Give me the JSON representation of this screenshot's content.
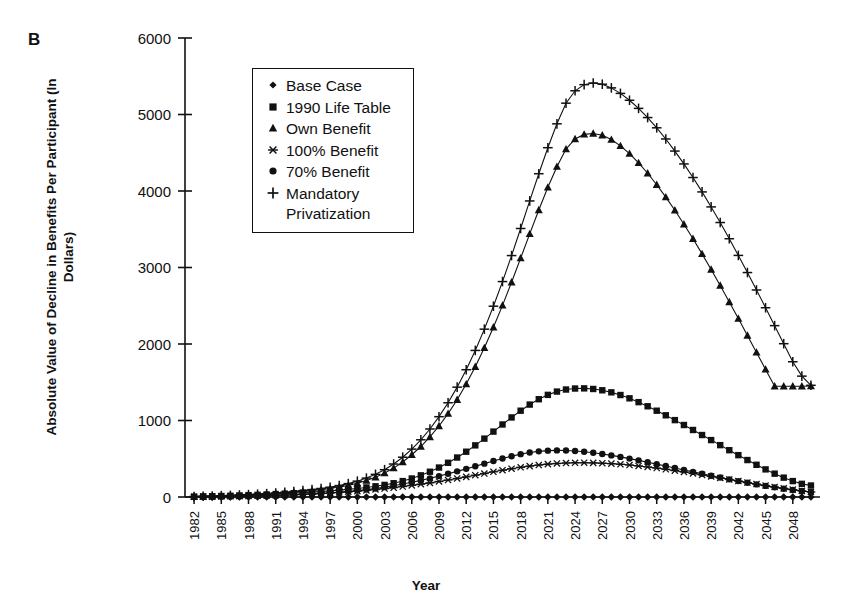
{
  "panel_label": "B",
  "axes": {
    "ylabel": "Absolute Value of Decline in Benefits Per Participant (In Dollars)",
    "xlabel": "Year"
  },
  "legend": {
    "items": [
      {
        "label": "Base Case",
        "marker": "diamond-marker"
      },
      {
        "label": "1990 Life Table",
        "marker": "square-marker"
      },
      {
        "label": "Own Benefit",
        "marker": "triangle-marker"
      },
      {
        "label": "100% Benefit",
        "marker": "asterisk-marker"
      },
      {
        "label": "70% Benefit",
        "marker": "circle-marker"
      },
      {
        "label": "Mandatory\nPrivatization",
        "marker": "plus-marker"
      }
    ]
  },
  "chart_data": {
    "type": "line",
    "title": "",
    "xlabel": "Year",
    "ylabel": "Absolute Value of Decline in Benefits Per Participant (In Dollars)",
    "xlim": [
      1981,
      2051
    ],
    "ylim": [
      0,
      6000
    ],
    "ytick_values": [
      0,
      1000,
      2000,
      3000,
      4000,
      5000,
      6000
    ],
    "ytick_labels": [
      "0",
      "1000",
      "2000",
      "3000",
      "4000",
      "5000",
      "6000"
    ],
    "xtick_labels": [
      "1982",
      "1985",
      "1988",
      "1991",
      "1994",
      "1997",
      "2000",
      "2003",
      "2006",
      "2009",
      "2012",
      "2015",
      "2018",
      "2021",
      "2024",
      "2027",
      "2030",
      "2033",
      "2036",
      "2039",
      "2042",
      "2045",
      "2048"
    ],
    "grid": false,
    "legend_position": "upper-left-inside",
    "x": [
      1982,
      1983,
      1984,
      1985,
      1986,
      1987,
      1988,
      1989,
      1990,
      1991,
      1992,
      1993,
      1994,
      1995,
      1996,
      1997,
      1998,
      1999,
      2000,
      2001,
      2002,
      2003,
      2004,
      2005,
      2006,
      2007,
      2008,
      2009,
      2010,
      2011,
      2012,
      2013,
      2014,
      2015,
      2016,
      2017,
      2018,
      2019,
      2020,
      2021,
      2022,
      2023,
      2024,
      2025,
      2026,
      2027,
      2028,
      2029,
      2030,
      2031,
      2032,
      2033,
      2034,
      2035,
      2036,
      2037,
      2038,
      2039,
      2040,
      2041,
      2042,
      2043,
      2044,
      2045,
      2046,
      2047,
      2048,
      2049,
      2050
    ],
    "series": [
      {
        "name": "Base Case",
        "marker": "diamond",
        "values": [
          0,
          0,
          0,
          0,
          0,
          0,
          0,
          0,
          0,
          0,
          0,
          0,
          0,
          0,
          0,
          0,
          0,
          0,
          0,
          0,
          0,
          0,
          0,
          0,
          0,
          0,
          0,
          0,
          0,
          0,
          0,
          0,
          0,
          0,
          0,
          0,
          0,
          0,
          0,
          0,
          0,
          0,
          0,
          0,
          0,
          0,
          0,
          0,
          0,
          0,
          0,
          0,
          0,
          0,
          0,
          0,
          0,
          0,
          0,
          0,
          0,
          0,
          0,
          0,
          0,
          0,
          0,
          0,
          0
        ]
      },
      {
        "name": "1990 Life Table",
        "marker": "square",
        "values": [
          5,
          8,
          10,
          13,
          16,
          20,
          24,
          28,
          33,
          38,
          44,
          50,
          57,
          64,
          72,
          80,
          90,
          100,
          112,
          125,
          140,
          158,
          180,
          208,
          242,
          283,
          330,
          385,
          447,
          516,
          592,
          675,
          763,
          855,
          948,
          1040,
          1128,
          1208,
          1278,
          1335,
          1378,
          1405,
          1418,
          1420,
          1412,
          1395,
          1368,
          1333,
          1290,
          1240,
          1186,
          1128,
          1068,
          1005,
          941,
          876,
          810,
          744,
          678,
          612,
          547,
          483,
          421,
          361,
          305,
          253,
          208,
          172,
          150
        ]
      },
      {
        "name": "Own Benefit",
        "marker": "triangle",
        "values": [
          6,
          9,
          12,
          15,
          19,
          23,
          28,
          33,
          39,
          46,
          54,
          63,
          73,
          84,
          97,
          112,
          130,
          152,
          180,
          215,
          258,
          312,
          378,
          458,
          552,
          660,
          785,
          928,
          1090,
          1272,
          1476,
          1702,
          1950,
          2218,
          2505,
          2808,
          3122,
          3440,
          3752,
          4048,
          4318,
          4548,
          4680,
          4740,
          4752,
          4728,
          4672,
          4590,
          4488,
          4368,
          4232,
          4082,
          3920,
          3748,
          3566,
          3376,
          3178,
          2974,
          2764,
          2550,
          2332,
          2112,
          1890,
          1668,
          1448,
          1448,
          1448,
          1448,
          1450
        ]
      },
      {
        "name": "100% Benefit",
        "marker": "asterisk",
        "values": [
          3,
          4,
          5,
          7,
          9,
          11,
          13,
          16,
          19,
          22,
          26,
          30,
          35,
          40,
          46,
          53,
          60,
          68,
          77,
          87,
          98,
          110,
          123,
          137,
          152,
          168,
          185,
          203,
          222,
          242,
          263,
          285,
          307,
          329,
          350,
          370,
          388,
          404,
          418,
          430,
          438,
          444,
          447,
          448,
          446,
          442,
          436,
          428,
          418,
          406,
          393,
          378,
          362,
          345,
          327,
          308,
          289,
          269,
          249,
          229,
          209,
          189,
          169,
          150,
          131,
          113,
          96,
          80,
          66
        ]
      },
      {
        "name": "70% Benefit",
        "marker": "circle",
        "values": [
          2,
          3,
          4,
          5,
          7,
          9,
          11,
          13,
          16,
          19,
          23,
          27,
          32,
          38,
          45,
          53,
          62,
          72,
          84,
          97,
          112,
          129,
          148,
          169,
          192,
          217,
          244,
          273,
          303,
          335,
          368,
          402,
          436,
          470,
          503,
          533,
          560,
          582,
          597,
          606,
          609,
          607,
          601,
          591,
          578,
          562,
          544,
          524,
          502,
          479,
          455,
          430,
          405,
          379,
          353,
          328,
          303,
          278,
          254,
          231,
          208,
          186,
          165,
          145,
          126,
          108,
          92,
          78,
          66
        ]
      },
      {
        "name": "Mandatory Privatization",
        "marker": "plus",
        "values": [
          7,
          10,
          13,
          17,
          21,
          26,
          31,
          37,
          44,
          52,
          61,
          71,
          83,
          96,
          111,
          128,
          149,
          175,
          207,
          247,
          296,
          357,
          431,
          520,
          626,
          748,
          889,
          1050,
          1232,
          1436,
          1664,
          1916,
          2194,
          2494,
          2816,
          3156,
          3510,
          3870,
          4226,
          4566,
          4878,
          5148,
          5310,
          5390,
          5412,
          5396,
          5348,
          5276,
          5186,
          5080,
          4960,
          4826,
          4680,
          4522,
          4354,
          4176,
          3988,
          3792,
          3588,
          3376,
          3158,
          2934,
          2706,
          2474,
          2240,
          2004,
          1768,
          1580,
          1460
        ]
      }
    ]
  }
}
